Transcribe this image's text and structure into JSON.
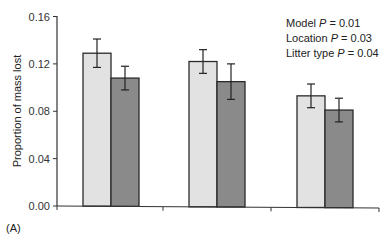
{
  "chart_data": {
    "type": "bar",
    "title": "",
    "panel_label": "(A)",
    "xlabel": "",
    "ylabel": "Proportion of mass lost",
    "ylim": [
      0.0,
      0.16
    ],
    "yticks": [
      "0.00",
      "0.04",
      "0.08",
      "0.12",
      "0.16"
    ],
    "grid": false,
    "legend": null,
    "categories": [
      "",
      "",
      ""
    ],
    "series": [
      {
        "name": "light bars",
        "color": "#e2e2e2",
        "values": [
          0.129,
          0.122,
          0.093
        ],
        "errors": [
          0.012,
          0.01,
          0.01
        ]
      },
      {
        "name": "dark bars",
        "color": "#8a8a8a",
        "values": [
          0.108,
          0.105,
          0.081
        ],
        "errors": [
          0.01,
          0.015,
          0.01
        ]
      }
    ],
    "annotations": [
      {
        "label": "Model",
        "p_symbol": "P",
        "value": "= 0.01"
      },
      {
        "label": "Location",
        "p_symbol": "P",
        "value": "= 0.03"
      },
      {
        "label": "Litter type",
        "p_symbol": "P",
        "value": "= 0.04"
      }
    ]
  }
}
